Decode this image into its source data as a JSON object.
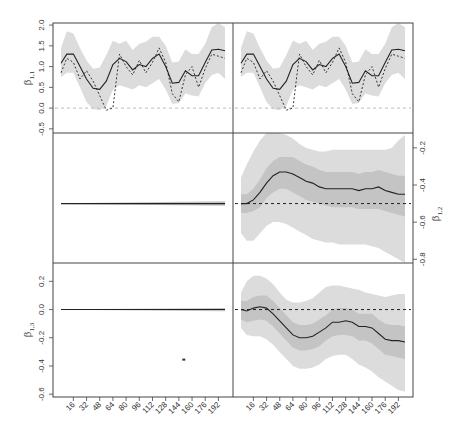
{
  "chart_data": {
    "type": "line",
    "layout": {
      "rows": 3,
      "cols": 2,
      "shared_x": true
    },
    "x_tick_labels": [
      "16",
      "32",
      "48",
      "64",
      "80",
      "96",
      "112",
      "128",
      "144",
      "160",
      "176",
      "192"
    ],
    "x_ticks": [
      16,
      32,
      48,
      64,
      80,
      96,
      112,
      128,
      144,
      160,
      176,
      192
    ],
    "x_range": [
      1,
      200
    ],
    "colors": {
      "outer_band": "#dcdcdc",
      "inner_band": "#c4c4c4",
      "line": "#222222",
      "dashed_ref": "#222222",
      "zero_ref": "#bbbbbb",
      "frame": "#444444"
    },
    "panels": [
      {
        "id": "beta_1_1_left",
        "row": 1,
        "col": 1,
        "ylabel": "β",
        "ylabel_sub": "1,1",
        "ylabel_side": "left",
        "ylim": [
          -0.6,
          2.05
        ],
        "y_ticks": [
          -0.5,
          0.0,
          0.5,
          1.0,
          1.5,
          2.0
        ],
        "y_tick_labels": [
          "-0.5",
          "0.0",
          "0.5",
          "1.0",
          "1.5",
          "2.0"
        ],
        "reference_line": {
          "y": 0.0,
          "style": "dashed-light"
        },
        "x": [
          1,
          8,
          16,
          24,
          32,
          40,
          48,
          56,
          64,
          72,
          80,
          88,
          96,
          104,
          112,
          120,
          128,
          136,
          144,
          152,
          160,
          168,
          176,
          184,
          192,
          200
        ],
        "mean": [
          1.08,
          1.3,
          1.3,
          1.0,
          0.7,
          0.48,
          0.45,
          0.65,
          1.05,
          1.2,
          1.12,
          0.92,
          1.05,
          1.0,
          1.2,
          1.3,
          1.0,
          0.6,
          0.62,
          0.9,
          0.78,
          0.78,
          1.1,
          1.4,
          1.42,
          1.38
        ],
        "lower": [
          0.75,
          0.85,
          0.85,
          0.5,
          0.15,
          -0.02,
          -0.05,
          0.05,
          0.45,
          0.55,
          0.5,
          0.45,
          0.55,
          0.5,
          0.6,
          0.7,
          0.45,
          0.1,
          0.12,
          0.35,
          0.3,
          0.28,
          0.6,
          0.8,
          0.85,
          0.7
        ],
        "upper": [
          1.45,
          1.85,
          1.8,
          1.45,
          1.15,
          0.95,
          0.98,
          1.28,
          1.62,
          1.55,
          1.62,
          1.4,
          1.55,
          1.6,
          1.72,
          1.72,
          1.5,
          1.1,
          1.12,
          1.42,
          1.3,
          1.3,
          1.55,
          1.95,
          2.05,
          1.95
        ],
        "dashed_series": [
          0.85,
          1.2,
          1.1,
          0.7,
          0.9,
          0.65,
          0.3,
          -0.05,
          0.0,
          1.3,
          1.0,
          0.8,
          1.15,
          0.85,
          1.1,
          1.45,
          1.1,
          0.35,
          0.15,
          0.8,
          1.0,
          0.5,
          0.95,
          1.3,
          1.25,
          1.2
        ]
      },
      {
        "id": "beta_1_1_right",
        "row": 1,
        "col": 2,
        "ylabel": "",
        "ylim": [
          -0.6,
          2.05
        ],
        "reference_line": {
          "y": 0.0,
          "style": "dashed-light"
        },
        "note": "same series as left-top panel"
      },
      {
        "id": "beta_1_2_left",
        "row": 2,
        "col": 1,
        "ylim": [
          -0.82,
          -0.12
        ],
        "flat_value": -0.5,
        "band_half_width_start": 0.002,
        "band_half_width_end": 0.012
      },
      {
        "id": "beta_1_2_right",
        "row": 2,
        "col": 2,
        "ylabel": "β",
        "ylabel_sub": "1,2",
        "ylabel_side": "right",
        "ylim": [
          -0.82,
          -0.12
        ],
        "y_ticks": [
          -0.8,
          -0.6,
          -0.4,
          -0.2
        ],
        "y_tick_labels": [
          "-0.8",
          "-0.6",
          "-0.4",
          "-0.2"
        ],
        "reference_line": {
          "y": -0.5,
          "style": "dashed-dark"
        },
        "x": [
          1,
          8,
          16,
          24,
          32,
          40,
          48,
          56,
          64,
          72,
          80,
          88,
          96,
          104,
          112,
          120,
          128,
          136,
          144,
          152,
          160,
          168,
          176,
          184,
          192,
          200
        ],
        "mean": [
          -0.5,
          -0.5,
          -0.48,
          -0.44,
          -0.39,
          -0.35,
          -0.33,
          -0.33,
          -0.34,
          -0.36,
          -0.38,
          -0.39,
          -0.41,
          -0.42,
          -0.42,
          -0.42,
          -0.42,
          -0.42,
          -0.43,
          -0.42,
          -0.42,
          -0.41,
          -0.43,
          -0.44,
          -0.45,
          -0.45
        ],
        "inner_lower": [
          -0.55,
          -0.55,
          -0.54,
          -0.52,
          -0.47,
          -0.44,
          -0.42,
          -0.42,
          -0.44,
          -0.46,
          -0.48,
          -0.49,
          -0.5,
          -0.51,
          -0.52,
          -0.52,
          -0.52,
          -0.52,
          -0.53,
          -0.53,
          -0.53,
          -0.53,
          -0.54,
          -0.55,
          -0.56,
          -0.57
        ],
        "inner_upper": [
          -0.45,
          -0.45,
          -0.42,
          -0.37,
          -0.31,
          -0.27,
          -0.25,
          -0.25,
          -0.25,
          -0.27,
          -0.29,
          -0.3,
          -0.32,
          -0.33,
          -0.33,
          -0.33,
          -0.33,
          -0.33,
          -0.34,
          -0.33,
          -0.33,
          -0.32,
          -0.33,
          -0.34,
          -0.35,
          -0.35
        ],
        "outer_lower": [
          -0.66,
          -0.7,
          -0.7,
          -0.66,
          -0.62,
          -0.6,
          -0.6,
          -0.61,
          -0.63,
          -0.65,
          -0.67,
          -0.69,
          -0.7,
          -0.71,
          -0.71,
          -0.72,
          -0.72,
          -0.72,
          -0.72,
          -0.72,
          -0.73,
          -0.74,
          -0.76,
          -0.78,
          -0.8,
          -0.82
        ],
        "outer_upper": [
          -0.36,
          -0.29,
          -0.22,
          -0.16,
          -0.12,
          -0.12,
          -0.12,
          -0.13,
          -0.15,
          -0.18,
          -0.2,
          -0.21,
          -0.22,
          -0.22,
          -0.21,
          -0.21,
          -0.21,
          -0.21,
          -0.21,
          -0.21,
          -0.21,
          -0.21,
          -0.21,
          -0.2,
          -0.16,
          -0.13
        ]
      },
      {
        "id": "beta_1_3_left",
        "row": 3,
        "col": 1,
        "ylabel": "β",
        "ylabel_sub": "1,3",
        "ylabel_side": "left",
        "ylim": [
          -0.62,
          0.33
        ],
        "y_ticks": [
          -0.6,
          -0.4,
          -0.2,
          0.0,
          0.2
        ],
        "y_tick_labels": [
          "-0.6",
          "-0.4",
          "-0.2",
          "0.0",
          "0.2"
        ],
        "reference_line": {
          "y": 0.0,
          "style": "dashed-dark"
        },
        "flat_value": 0.0,
        "band_half_width_start": 0.002,
        "band_half_width_end": 0.012,
        "annotation": {
          "type": "stray-mark",
          "x": 150,
          "y": -0.355
        }
      },
      {
        "id": "beta_1_3_right",
        "row": 3,
        "col": 2,
        "ylim": [
          -0.62,
          0.33
        ],
        "reference_line": {
          "y": 0.0,
          "style": "dashed-dark"
        },
        "x": [
          1,
          8,
          16,
          24,
          32,
          40,
          48,
          56,
          64,
          72,
          80,
          88,
          96,
          104,
          112,
          120,
          128,
          136,
          144,
          152,
          160,
          168,
          176,
          184,
          192,
          200
        ],
        "mean": [
          0.0,
          -0.01,
          0.01,
          0.02,
          0.01,
          -0.03,
          -0.08,
          -0.13,
          -0.18,
          -0.2,
          -0.2,
          -0.19,
          -0.16,
          -0.13,
          -0.09,
          -0.09,
          -0.08,
          -0.09,
          -0.12,
          -0.12,
          -0.13,
          -0.17,
          -0.21,
          -0.22,
          -0.22,
          -0.23
        ],
        "inner_lower": [
          -0.07,
          -0.09,
          -0.08,
          -0.07,
          -0.08,
          -0.12,
          -0.17,
          -0.22,
          -0.27,
          -0.29,
          -0.29,
          -0.28,
          -0.26,
          -0.22,
          -0.19,
          -0.18,
          -0.18,
          -0.19,
          -0.22,
          -0.22,
          -0.24,
          -0.28,
          -0.32,
          -0.33,
          -0.34,
          -0.35
        ],
        "inner_upper": [
          0.06,
          0.06,
          0.09,
          0.1,
          0.1,
          0.06,
          0.01,
          -0.04,
          -0.09,
          -0.11,
          -0.11,
          -0.1,
          -0.07,
          -0.04,
          0.0,
          0.01,
          0.01,
          0.0,
          -0.03,
          -0.03,
          -0.03,
          -0.07,
          -0.1,
          -0.11,
          -0.11,
          -0.12
        ],
        "outer_lower": [
          -0.13,
          -0.18,
          -0.19,
          -0.19,
          -0.21,
          -0.25,
          -0.3,
          -0.35,
          -0.4,
          -0.42,
          -0.42,
          -0.41,
          -0.39,
          -0.35,
          -0.33,
          -0.32,
          -0.32,
          -0.35,
          -0.39,
          -0.41,
          -0.44,
          -0.48,
          -0.51,
          -0.54,
          -0.57,
          -0.58
        ],
        "outer_upper": [
          0.12,
          0.2,
          0.24,
          0.24,
          0.22,
          0.18,
          0.12,
          0.07,
          0.05,
          0.05,
          0.06,
          0.08,
          0.12,
          0.16,
          0.17,
          0.17,
          0.16,
          0.15,
          0.14,
          0.12,
          0.11,
          0.1,
          0.09,
          0.1,
          0.11,
          0.11
        ]
      }
    ],
    "title": "",
    "legend": null,
    "grid": false
  }
}
